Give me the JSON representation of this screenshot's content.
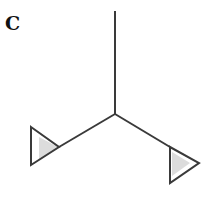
{
  "panel_label": "C",
  "diagram": {
    "line_color": "#3a3a3a",
    "wedge_fill": "#d9d9d9"
  }
}
